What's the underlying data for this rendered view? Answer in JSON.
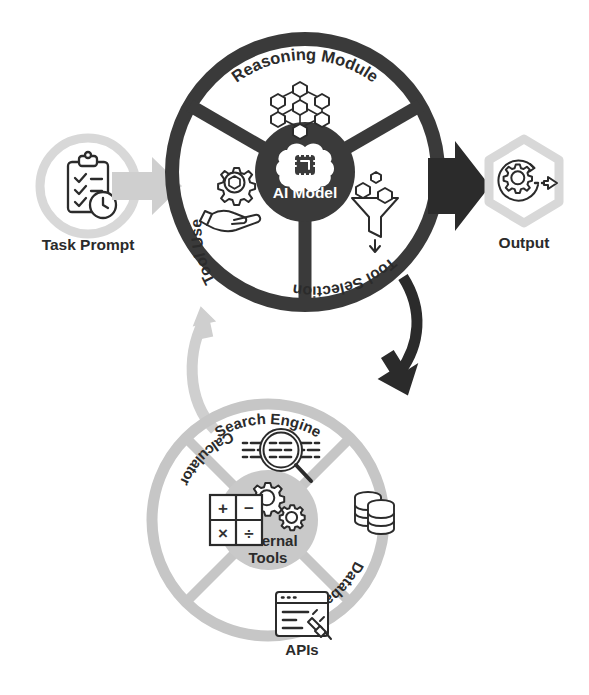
{
  "diagram": {
    "colors": {
      "dark_ring": "#3a3a3a",
      "dark_hub": "#3a3a3a",
      "light_ring": "#c6c6c6",
      "light_hub": "#c9c9c9",
      "light_arrow": "#cfcfcf",
      "dark_arrow": "#2b2b2b",
      "icon_stroke": "#2b2b2b",
      "label_text": "#2b2b2b",
      "hub_text": "#ffffff",
      "background": "#ffffff"
    }
  },
  "input": {
    "label": "Task Prompt",
    "icon": "clipboard-checklist-clock-icon",
    "badge_shape": "circle"
  },
  "output": {
    "label": "Output",
    "icon": "gear-refresh-arrow-icon",
    "badge_shape": "hexagon"
  },
  "agent_wheel": {
    "hub_label_line1": "AI Model",
    "hub_icon": "brain-chip-icon",
    "segments": [
      {
        "label": "Reasoning Module",
        "icon": "node-network-cubes-icon",
        "position": "top"
      },
      {
        "label": "Tool Selection",
        "icon": "funnel-cubes-icon",
        "position": "bottom-right"
      },
      {
        "label": "Tool Use",
        "icon": "hand-gear-cube-icon",
        "position": "bottom-left"
      }
    ]
  },
  "tools_wheel": {
    "hub_label_line1": "External",
    "hub_label_line2": "Tools",
    "hub_icon": "two-gears-icon",
    "segments": [
      {
        "label": "Search Engine",
        "icon": "magnifier-text-icon",
        "position": "top"
      },
      {
        "label": "Database",
        "icon": "database-stack-icon",
        "position": "right"
      },
      {
        "label": "APIs",
        "icon": "browser-plug-icon",
        "position": "bottom"
      },
      {
        "label": "Calculator",
        "icon": "calculator-operators-icon",
        "position": "left"
      }
    ]
  },
  "connectors": [
    {
      "name": "agent-to-tools-arrow",
      "direction": "down-right",
      "color": "#2b2b2b",
      "from": "agent_wheel",
      "to": "tools_wheel"
    },
    {
      "name": "tools-to-agent-arrow",
      "direction": "up-left",
      "color": "#cfcfcf",
      "from": "tools_wheel",
      "to": "agent_wheel"
    },
    {
      "name": "prompt-to-agent-arrow",
      "direction": "right",
      "color": "#cfcfcf",
      "from": "input",
      "to": "agent_wheel"
    },
    {
      "name": "agent-to-output-arrow",
      "direction": "right",
      "color": "#2b2b2b",
      "from": "agent_wheel",
      "to": "output"
    }
  ],
  "calculator_keys": [
    "+",
    "−",
    "×",
    "÷"
  ]
}
